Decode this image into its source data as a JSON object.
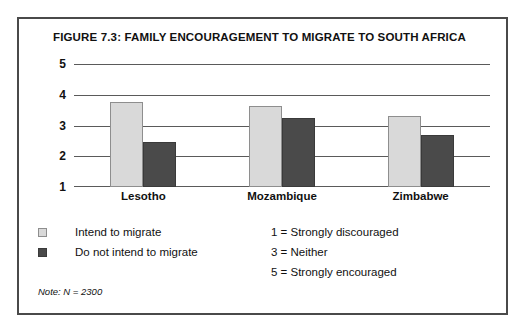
{
  "figure": {
    "title": "FIGURE 7.3: FAMILY ENCOURAGEMENT TO MIGRATE TO SOUTH AFRICA",
    "note": "Note: N = 2300"
  },
  "legend": {
    "items": [
      {
        "label": "Intend to migrate",
        "color": "#d9d9d9"
      },
      {
        "label": "Do not intend to migrate",
        "color": "#4a4a4a"
      }
    ]
  },
  "scale_key": {
    "lines": [
      "1 = Strongly discouraged",
      "3 = Neither",
      "5 = Strongly encouraged"
    ]
  },
  "chart_data": {
    "type": "bar",
    "title": "FIGURE 7.3: FAMILY ENCOURAGEMENT TO MIGRATE TO SOUTH AFRICA",
    "xlabel": "",
    "ylabel": "",
    "categories": [
      "Lesotho",
      "Mozambique",
      "Zimbabwe"
    ],
    "series": [
      {
        "name": "Intend to migrate",
        "color": "#d9d9d9",
        "values": [
          3.75,
          3.65,
          3.3
        ]
      },
      {
        "name": "Do not intend to migrate",
        "color": "#4a4a4a",
        "values": [
          2.45,
          3.25,
          2.7
        ]
      }
    ],
    "ylim": [
      1,
      5
    ],
    "yticks": [
      5,
      4,
      3,
      2,
      1
    ],
    "grid": true,
    "legend_position": "below-left",
    "annotations": [
      "1 = Strongly discouraged",
      "3 = Neither",
      "5 = Strongly encouraged",
      "Note: N = 2300"
    ]
  }
}
